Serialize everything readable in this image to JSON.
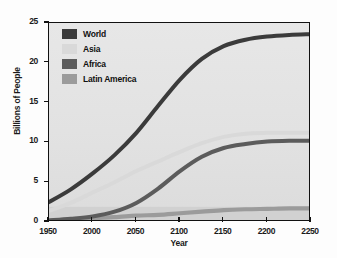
{
  "chart_data": {
    "type": "line",
    "title": "",
    "xlabel": "Year",
    "ylabel": "Billions of People",
    "xlim": [
      1950,
      2250
    ],
    "ylim": [
      0,
      25
    ],
    "xticks": [
      "1950",
      "2000",
      "2050",
      "2100",
      "2150",
      "2200",
      "2250"
    ],
    "yticks": [
      "0",
      "5",
      "10",
      "15",
      "20",
      "25"
    ],
    "grid": false,
    "legend_position": "top-left",
    "x": [
      1950,
      1975,
      2000,
      2025,
      2050,
      2075,
      2100,
      2125,
      2150,
      2175,
      2200,
      2225,
      2250
    ],
    "series": [
      {
        "name": "World",
        "color": "#3b3b3b",
        "values": [
          2.5,
          4.1,
          6.1,
          8.4,
          11.2,
          14.6,
          17.9,
          20.5,
          22.1,
          22.9,
          23.3,
          23.5,
          23.6
        ]
      },
      {
        "name": "Asia",
        "color": "#d9d9d9",
        "values": [
          1.4,
          2.4,
          3.7,
          5.0,
          6.4,
          7.6,
          8.8,
          9.9,
          10.7,
          11.1,
          11.2,
          11.2,
          11.2
        ]
      },
      {
        "name": "Africa",
        "color": "#5c5c5c",
        "values": [
          0.2,
          0.4,
          0.7,
          1.3,
          2.4,
          4.2,
          6.4,
          8.2,
          9.3,
          9.8,
          10.1,
          10.2,
          10.2
        ]
      },
      {
        "name": "Latin America",
        "color": "#9b9b9b",
        "values": [
          0.2,
          0.3,
          0.5,
          0.6,
          0.8,
          0.9,
          1.1,
          1.3,
          1.5,
          1.6,
          1.65,
          1.7,
          1.7
        ]
      }
    ]
  },
  "legend": {
    "items": [
      {
        "label": "World",
        "color": "#3b3b3b"
      },
      {
        "label": "Asia",
        "color": "#d9d9d9"
      },
      {
        "label": "Africa",
        "color": "#5c5c5c"
      },
      {
        "label": "Latin America",
        "color": "#9b9b9b"
      }
    ]
  },
  "axes": {
    "ylabel": "Billions of People",
    "xlabel": "Year"
  }
}
